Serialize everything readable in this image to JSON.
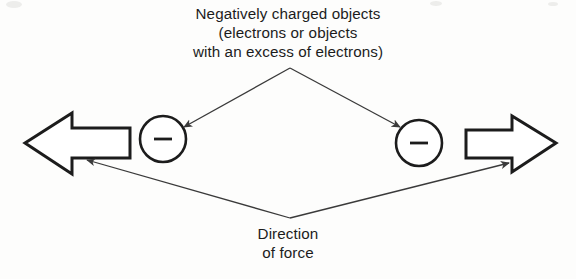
{
  "figure": {
    "background_color": "#fdfdfc",
    "stroke_color": "#1c1c1c",
    "leader_color": "#3a3a3a"
  },
  "caption_top": {
    "lines": [
      "Negatively charged objects",
      "(electrons or objects",
      "with an excess of electrons)"
    ]
  },
  "caption_bottom": {
    "lines": [
      "Direction",
      "of force"
    ]
  },
  "charges": [
    {
      "id": "left-charge",
      "symbol": "−",
      "polarity": "negative",
      "center_x": 163,
      "center_y": 139,
      "radius": 23
    },
    {
      "id": "right-charge",
      "symbol": "−",
      "polarity": "negative",
      "center_x": 419,
      "center_y": 143,
      "radius": 23
    }
  ],
  "force_arrows": [
    {
      "id": "left-force-arrow",
      "direction": "left",
      "tip_x": 25,
      "tail_x": 130,
      "center_y": 143
    },
    {
      "id": "right-force-arrow",
      "direction": "right",
      "tip_x": 556,
      "tail_x": 466,
      "center_y": 143
    }
  ],
  "leaders": {
    "top": {
      "apex_x": 290,
      "apex_y": 68,
      "targets": [
        "left-charge",
        "right-charge"
      ]
    },
    "bottom": {
      "vertex_x": 290,
      "vertex_y": 218,
      "targets": [
        "left-force-arrow",
        "right-force-arrow"
      ]
    }
  }
}
